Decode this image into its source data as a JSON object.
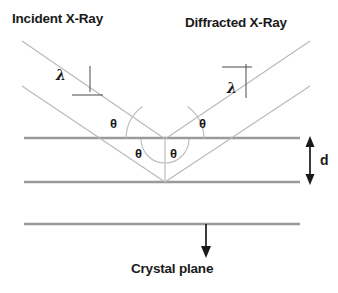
{
  "figure": {
    "type": "diagram",
    "background_color": "#ffffff"
  },
  "labels": {
    "incident_ray": "Incident X-Ray",
    "diffracted_ray": "Diffracted X-Ray",
    "wavelength_left": "λ",
    "wavelength_right": "λ",
    "theta_upper_left": "θ",
    "theta_upper_right": "θ",
    "theta_lower_left": "θ",
    "theta_lower_right": "θ",
    "spacing": "d",
    "crystal_plane": "Crystal plane"
  },
  "colors": {
    "plane_line": "#9a9a9a",
    "ray_line": "#b5b5b5",
    "annotation": "#1a1a1a",
    "text": "#1a1a1a"
  },
  "geometry": {
    "vertex_x": 165,
    "vertex_y": 139,
    "plane_y_top": 138,
    "plane_y_middle": 182,
    "plane_y_bottom": 224,
    "plane_x_start": 24,
    "plane_x_end": 300,
    "interplanar_spacing_label": "d"
  }
}
